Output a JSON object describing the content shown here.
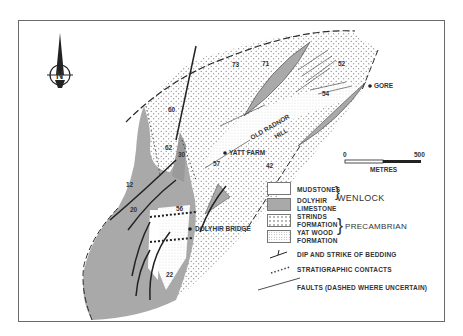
{
  "map": {
    "north_arrow": "N",
    "places": [
      {
        "name": "GORE"
      },
      {
        "name": "YATT FARM"
      },
      {
        "name": "DOLYHIR BRIDGE"
      }
    ],
    "hill_label_1": "OLD RADNOR",
    "hill_label_2": "HILL",
    "dips": [
      "73",
      "71",
      "52",
      "54",
      "60",
      "62",
      "30",
      "57",
      "42",
      "12",
      "20",
      "56",
      "22"
    ]
  },
  "scale_bar": {
    "min": "0",
    "max": "500",
    "unit": "METRES"
  },
  "legend": {
    "units": [
      {
        "label_1": "MUDSTONES",
        "label_2": ""
      },
      {
        "label_1": "DOLYHIR",
        "label_2": "LIMESTONE"
      },
      {
        "label_1": "STRINDS",
        "label_2": "FORMATION"
      },
      {
        "label_1": "YAT WOOD",
        "label_2": "FORMATION"
      }
    ],
    "groups": [
      "WENLOCK",
      "PRECAMBRIAN"
    ],
    "symbols": [
      "DIP AND STRIKE OF BEDDING",
      "STRATIGRAPHIC CONTACTS",
      "FAULTS (DASHED WHERE UNCERTAIN)"
    ]
  },
  "colors": {
    "limestone": "#a9a9a9",
    "ink": "#2a2a2a",
    "frame": "#6a6a6a"
  }
}
